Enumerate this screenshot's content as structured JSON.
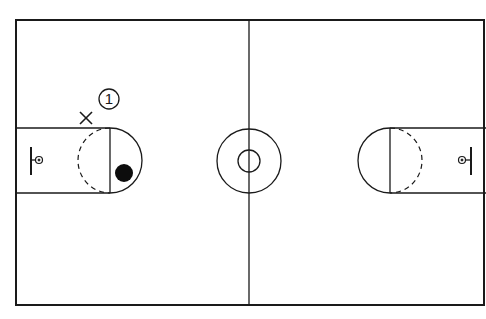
{
  "diagram": {
    "colors": {
      "line": "#1a1a1a",
      "background": "#ffffff",
      "ball": "#0d0d0d"
    },
    "court": {
      "left": 16,
      "top": 20,
      "right": 484,
      "bottom": 305,
      "center_x": 249,
      "center_y": 160
    },
    "center_circle": {
      "outer_r": 32,
      "inner_r": 11
    },
    "left_key": {
      "lane_top": 128,
      "lane_bottom": 193,
      "free_throw_x": 110,
      "circle_r": 32,
      "basket_x": 38
    },
    "right_key": {
      "lane_top": 128,
      "lane_bottom": 193,
      "free_throw_x": 390,
      "circle_r": 32,
      "basket_x": 462
    },
    "markers": {
      "defender": {
        "symbol": "X",
        "x": 86,
        "y": 118
      },
      "offense_player": {
        "symbol": "1",
        "x": 109,
        "y": 99,
        "r": 10
      },
      "ball": {
        "x": 124,
        "y": 173,
        "r": 9
      }
    }
  }
}
